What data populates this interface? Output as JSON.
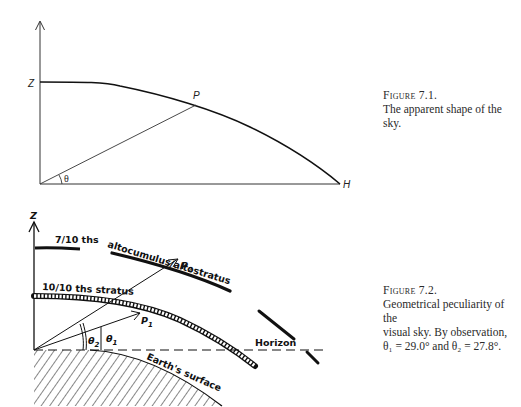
{
  "figure1": {
    "labels": {
      "zenith": "Z",
      "point": "P",
      "horizon": "H",
      "angle": "θ"
    },
    "caption": {
      "title": "Figure 7.1.",
      "text": "The apparent shape of the sky."
    }
  },
  "figure2": {
    "labels": {
      "zenith": "Z",
      "cloud_high": "7/10 ths",
      "cloud_mid": "altocumulus/altostratus",
      "cloud_low": "10/10 ths stratus",
      "p2": "P",
      "p2_sub": "2",
      "p1": "P",
      "p1_sub": "1",
      "theta2": "θ",
      "theta2_sub": "2",
      "theta1": "θ",
      "theta1_sub": "1",
      "horizon": "Horizon",
      "earth": "Earth's surface"
    },
    "caption": {
      "title": "Figure 7.2.",
      "line1": "Geometrical peculiarity of the",
      "line2": "visual sky. By observation,",
      "line3": "θ₁ = 29.0° and θ₂ = 27.8°."
    },
    "values": {
      "theta1_deg": 29.0,
      "theta2_deg": 27.8
    }
  }
}
